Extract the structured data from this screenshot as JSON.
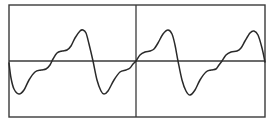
{
  "diagram": {
    "title": "",
    "frame": {
      "x": 9,
      "y": 5,
      "width": 256,
      "height": 112,
      "stroke": "#3a3a3a"
    },
    "axis": {
      "y": 61,
      "stroke": "#3a3a3a"
    },
    "center_line": {
      "x": 136,
      "stroke": "#3a3a3a"
    },
    "waveform": {
      "stroke": "#2a2a2a",
      "description": "periodic sawtooth-like wave with harmonic ripples, 3 periods",
      "points": [
        [
          9,
          63
        ],
        [
          11,
          78
        ],
        [
          14,
          89
        ],
        [
          19,
          94
        ],
        [
          24,
          90
        ],
        [
          29,
          80
        ],
        [
          35,
          72
        ],
        [
          41,
          70
        ],
        [
          46,
          69
        ],
        [
          50,
          65
        ],
        [
          53,
          59
        ],
        [
          57,
          53
        ],
        [
          62,
          51
        ],
        [
          67,
          50
        ],
        [
          71,
          46
        ],
        [
          75,
          38
        ],
        [
          80,
          31
        ],
        [
          83,
          30
        ],
        [
          86,
          33
        ],
        [
          89,
          44
        ],
        [
          93,
          61
        ],
        [
          97,
          80
        ],
        [
          101,
          91
        ],
        [
          104,
          94
        ],
        [
          108,
          91
        ],
        [
          114,
          80
        ],
        [
          120,
          72
        ],
        [
          126,
          70
        ],
        [
          130,
          68
        ],
        [
          133,
          64
        ],
        [
          136,
          61
        ],
        [
          140,
          55
        ],
        [
          145,
          52
        ],
        [
          150,
          51
        ],
        [
          154,
          49
        ],
        [
          158,
          43
        ],
        [
          163,
          34
        ],
        [
          168,
          30
        ],
        [
          172,
          34
        ],
        [
          175,
          45
        ],
        [
          178,
          61
        ],
        [
          182,
          80
        ],
        [
          186,
          91
        ],
        [
          190,
          95
        ],
        [
          195,
          90
        ],
        [
          200,
          80
        ],
        [
          206,
          72
        ],
        [
          211,
          70
        ],
        [
          216,
          69
        ],
        [
          219,
          65
        ],
        [
          222,
          61
        ],
        [
          226,
          55
        ],
        [
          231,
          52
        ],
        [
          237,
          51
        ],
        [
          241,
          48
        ],
        [
          245,
          41
        ],
        [
          250,
          33
        ],
        [
          254,
          31
        ],
        [
          258,
          35
        ],
        [
          262,
          48
        ],
        [
          265,
          62
        ]
      ]
    }
  }
}
